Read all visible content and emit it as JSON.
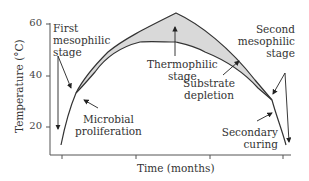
{
  "figure": {
    "type": "diagram",
    "y_axis": {
      "label": "Temperature (°C)",
      "ticks": [
        "60",
        "40",
        "20"
      ]
    },
    "x_axis": {
      "label": "Time (months)"
    },
    "annotations": {
      "first_mesophilic": [
        "First",
        "mesophilic",
        "stage"
      ],
      "microbial_proliferation": [
        "Microbial",
        "proliferation"
      ],
      "thermophilic": [
        "Thermophilic",
        "stage"
      ],
      "substrate_depletion": [
        "Substrate",
        "depletion"
      ],
      "second_mesophilic": [
        "Second",
        "mesophilic",
        "stage"
      ],
      "secondary_curing": [
        "Secondary",
        "curing"
      ]
    },
    "colors": {
      "band_fill": "#d9d9d9",
      "line": "#333333",
      "text": "#333333"
    }
  }
}
